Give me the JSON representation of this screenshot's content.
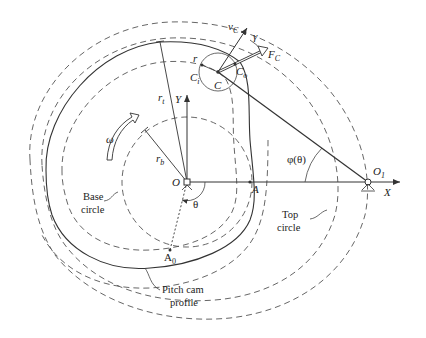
{
  "diagram": {
    "points": {
      "O": "O",
      "O1": "O",
      "O1_sub": "1",
      "A": "A",
      "A0": "A",
      "A0_sub": "0",
      "C": "C",
      "Ci": "C",
      "Ci_sub": "i",
      "Co": "C",
      "Co_sub": "o"
    },
    "axes": {
      "x": "X",
      "y": "Y"
    },
    "symbols": {
      "omega": "ω",
      "theta": "θ",
      "phi": "φ(θ)",
      "gamma": "γ",
      "r": "r",
      "rt": "r",
      "rt_sub": "t",
      "rb": "r",
      "rb_sub": "b",
      "vC": "v",
      "vC_sub": "C",
      "FC": "F",
      "FC_sub": "C"
    },
    "captions": {
      "base_circle_1": "Base",
      "base_circle_2": "circle",
      "top_circle_1": "Top",
      "top_circle_2": "circle",
      "pitch_profile_1": "Pitch cam",
      "pitch_profile_2": "profile"
    },
    "colors": {
      "line": "#333333",
      "dashed": "#555555",
      "background": "#ffffff"
    }
  }
}
